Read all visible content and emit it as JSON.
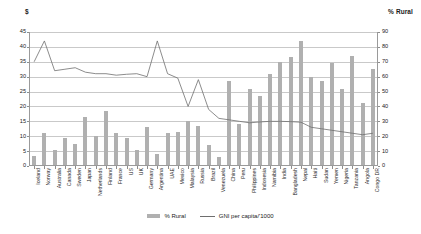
{
  "axis_titles": {
    "left": "$",
    "right": "% Rural"
  },
  "legend": {
    "bar_label": "% Rural",
    "line_label": "GNI per capita/'1000"
  },
  "colors": {
    "bar": "#b0b0b0",
    "line": "#6e6e6e",
    "grid": "#c9c9c9",
    "axis": "#9a9a9a"
  },
  "chart_data": {
    "type": "bar",
    "title": "",
    "subtitle": "",
    "xlabel": "",
    "ylabel": "$",
    "y2label": "% Rural",
    "ylim": [
      0,
      45
    ],
    "y2lim": [
      0,
      90
    ],
    "yticks": [
      0,
      5,
      10,
      15,
      20,
      25,
      30,
      35,
      40,
      45
    ],
    "y2ticks": [
      0,
      10,
      20,
      30,
      40,
      50,
      60,
      70,
      80,
      90
    ],
    "grid": true,
    "legend_position": "bottom",
    "categories": [
      "Iceland",
      "Norway",
      "Australia",
      "Canada",
      "Sweden",
      "Japan",
      "Netherlands",
      "Finland",
      "France",
      "US",
      "UK",
      "Germany",
      "Argentina",
      "UAE",
      "Mexico",
      "Malaysia",
      "Russia",
      "Brazil",
      "Venezuela",
      "China",
      "Peru",
      "Philippines",
      "Indonesia",
      "Namibia",
      "India",
      "Bangladesh",
      "Nepal",
      "Haiti",
      "Sudan",
      "Yemen",
      "Nigeria",
      "Tanzania",
      "Angola",
      "Congo DR"
    ],
    "series": [
      {
        "name": "% Rural",
        "axis": "right",
        "type": "bar",
        "values": [
          7,
          22,
          11,
          19,
          15,
          33,
          20,
          37,
          22,
          19,
          11,
          26,
          8,
          22,
          23,
          30,
          27,
          14,
          6,
          57,
          28,
          52,
          47,
          62,
          70,
          73,
          84,
          60,
          57,
          69,
          52,
          74,
          42,
          65
        ]
      },
      {
        "name": "GNI per capita/'1000",
        "axis": "left",
        "type": "line",
        "values": [
          35,
          42,
          32,
          32.5,
          33,
          31.5,
          31,
          31,
          30.5,
          30.8,
          31,
          30,
          42,
          31,
          29.5,
          20,
          29,
          19,
          16,
          15.5,
          15,
          14.5,
          14.8,
          15,
          15,
          14.9,
          14.7,
          13,
          12.5,
          12,
          11.5,
          11,
          10.5,
          11
        ]
      }
    ]
  }
}
